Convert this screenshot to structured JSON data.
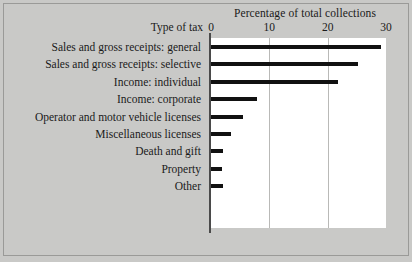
{
  "chart_data": {
    "type": "bar",
    "orientation": "horizontal",
    "title": "Percentage of total collections",
    "xlabel": "Percentage of total collections",
    "ylabel": "Type of tax",
    "xlim": [
      0,
      30
    ],
    "xticks": [
      0,
      10,
      20,
      30
    ],
    "xtick_labels": [
      "0",
      "10",
      "20",
      "30"
    ],
    "grid": true,
    "grid_axis": "x",
    "legend": null,
    "categories": [
      "Sales and gross receipts: general",
      "Sales and gross receipts: selective",
      "Income: individual",
      "Income: corporate",
      "Operator and motor vehicle licenses",
      "Miscellaneous licenses",
      "Death and gift",
      "Property",
      "Other"
    ],
    "values": [
      29.1,
      25.2,
      21.7,
      7.9,
      5.5,
      3.5,
      2.0,
      1.9,
      2.1
    ],
    "bar_color": "#111111",
    "plot_background": "#ffffff",
    "figure_background": "#c9c9c7"
  }
}
